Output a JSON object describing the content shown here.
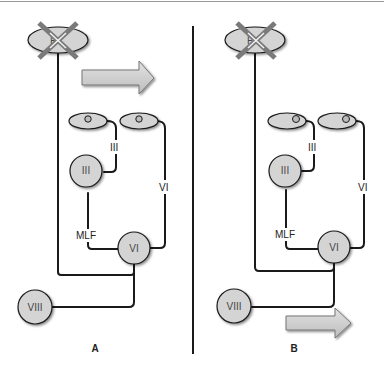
{
  "diagram": {
    "panels": [
      {
        "id": "A",
        "label": "A",
        "crossed_nucleus_label": "P",
        "labels": {
          "nerve_III": "III",
          "nerve_VI": "VI",
          "nucleus_III": "III",
          "nucleus_VI": "VI",
          "mlf": "MLF",
          "nucleus_VIII": "VIII"
        },
        "arrow_position": "top",
        "arrow_direction": "right",
        "pupil_position": "center"
      },
      {
        "id": "B",
        "label": "B",
        "crossed_nucleus_label": "P",
        "labels": {
          "nerve_III": "III",
          "nerve_VI": "VI",
          "nucleus_III": "III",
          "nucleus_VI": "VI",
          "mlf": "MLF",
          "nucleus_VIII": "VIII"
        },
        "arrow_position": "bottom",
        "arrow_direction": "right",
        "pupil_position": "right"
      }
    ],
    "colors": {
      "fill": "#d4d4d4",
      "stroke": "#1a1a1a",
      "cross": "#7a7a7a",
      "divider": "#1a1a1a",
      "top_rule": "#9a9a9a"
    }
  }
}
